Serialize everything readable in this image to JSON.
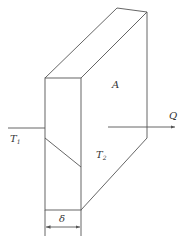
{
  "diagram": {
    "type": "plane-wall-heat-conduction",
    "labels": {
      "area": "A",
      "heat_flow": "Q",
      "temp_left": "T",
      "temp_left_sub": "1",
      "temp_right": "T",
      "temp_right_sub": "2",
      "thickness": "δ"
    },
    "colors": {
      "line": "#555555",
      "text": "#333333",
      "background": "#ffffff"
    }
  }
}
